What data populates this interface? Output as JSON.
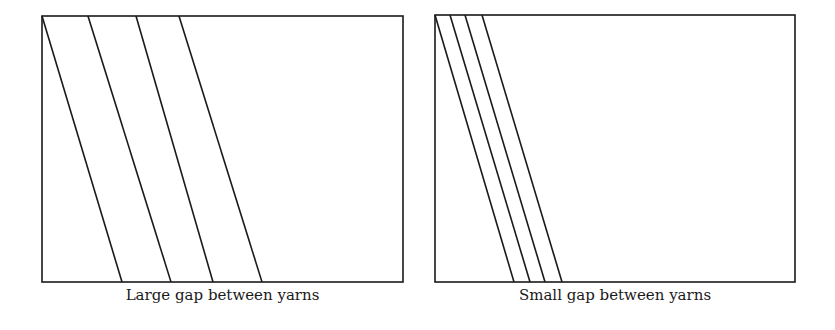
{
  "panels": [
    {
      "id": "left",
      "caption": "Large gap between yarns",
      "frame": {
        "x": 42,
        "y": 16,
        "w": 361,
        "h": 266
      },
      "yarns": [
        {
          "x_top": 42,
          "x_bottom": 122
        },
        {
          "x_top": 88,
          "x_bottom": 171
        },
        {
          "x_top": 136,
          "x_bottom": 213
        },
        {
          "x_top": 179,
          "x_bottom": 262
        }
      ]
    },
    {
      "id": "right",
      "caption": "Small gap between yarns",
      "frame": {
        "x": 435,
        "y": 15,
        "w": 360,
        "h": 267
      },
      "yarns": [
        {
          "x_top": 435,
          "x_bottom": 514
        },
        {
          "x_top": 450,
          "x_bottom": 530
        },
        {
          "x_top": 465,
          "x_bottom": 545
        },
        {
          "x_top": 482,
          "x_bottom": 562
        }
      ]
    }
  ],
  "colors": {
    "stroke": "#1a1a1a",
    "background": "#ffffff"
  }
}
